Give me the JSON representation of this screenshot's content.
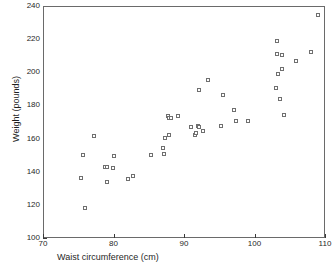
{
  "chart_data": {
    "type": "scatter",
    "title": "",
    "xlabel": "Waist circumference (cm)",
    "ylabel": "Weight (pounds)",
    "xlim": [
      70,
      110
    ],
    "ylim": [
      100,
      240
    ],
    "xticks": [
      70,
      80,
      90,
      100,
      110
    ],
    "yticks": [
      100,
      120,
      140,
      160,
      180,
      200,
      220,
      240
    ],
    "grid": false,
    "legend": null,
    "marker": "open-square",
    "marker_color": "#6f6f6f",
    "frame_color": "#6a6a6a",
    "n_points": 44,
    "points": [
      {
        "x": 75.3,
        "y": 137.0
      },
      {
        "x": 75.6,
        "y": 150.6
      },
      {
        "x": 75.8,
        "y": 118.6
      },
      {
        "x": 77.1,
        "y": 162.0
      },
      {
        "x": 78.7,
        "y": 143.4
      },
      {
        "x": 78.9,
        "y": 134.6
      },
      {
        "x": 79.0,
        "y": 143.2
      },
      {
        "x": 79.8,
        "y": 143.0
      },
      {
        "x": 79.9,
        "y": 150.0
      },
      {
        "x": 81.9,
        "y": 136.4
      },
      {
        "x": 82.6,
        "y": 138.0
      },
      {
        "x": 85.2,
        "y": 150.8
      },
      {
        "x": 86.9,
        "y": 155.0
      },
      {
        "x": 87.0,
        "y": 151.4
      },
      {
        "x": 87.2,
        "y": 161.2
      },
      {
        "x": 87.6,
        "y": 174.2
      },
      {
        "x": 87.7,
        "y": 173.2
      },
      {
        "x": 87.8,
        "y": 162.8
      },
      {
        "x": 88.0,
        "y": 173.0
      },
      {
        "x": 89.0,
        "y": 174.0
      },
      {
        "x": 90.9,
        "y": 167.6
      },
      {
        "x": 91.4,
        "y": 163.0
      },
      {
        "x": 91.5,
        "y": 164.2
      },
      {
        "x": 91.9,
        "y": 168.2
      },
      {
        "x": 92.0,
        "y": 167.4
      },
      {
        "x": 92.0,
        "y": 189.8
      },
      {
        "x": 92.6,
        "y": 165.4
      },
      {
        "x": 93.3,
        "y": 196.2
      },
      {
        "x": 95.1,
        "y": 168.4
      },
      {
        "x": 95.4,
        "y": 187.0
      },
      {
        "x": 96.9,
        "y": 177.6
      },
      {
        "x": 97.3,
        "y": 171.2
      },
      {
        "x": 99.0,
        "y": 171.4
      },
      {
        "x": 102.9,
        "y": 191.4
      },
      {
        "x": 103.0,
        "y": 211.6
      },
      {
        "x": 103.1,
        "y": 219.2
      },
      {
        "x": 103.2,
        "y": 199.8
      },
      {
        "x": 103.5,
        "y": 184.6
      },
      {
        "x": 103.7,
        "y": 202.8
      },
      {
        "x": 103.8,
        "y": 211.0
      },
      {
        "x": 104.1,
        "y": 174.8
      },
      {
        "x": 105.8,
        "y": 207.4
      },
      {
        "x": 107.9,
        "y": 212.6
      },
      {
        "x": 108.8,
        "y": 235.0
      }
    ]
  },
  "axes": {
    "x_tick_labels": [
      "70",
      "80",
      "90",
      "100",
      "110"
    ],
    "y_tick_labels": [
      "100",
      "120",
      "140",
      "160",
      "180",
      "200",
      "220",
      "240"
    ]
  }
}
